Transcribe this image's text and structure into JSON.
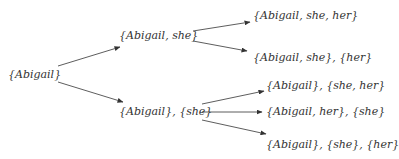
{
  "diagram": {
    "type": "tree",
    "root": {
      "id": "n0",
      "label": "{Abigail}"
    },
    "level1": [
      {
        "id": "n1",
        "label": "{Abigail, she}"
      },
      {
        "id": "n2",
        "label": "{Abigail}, {she}"
      }
    ],
    "level2": [
      {
        "id": "n3",
        "label": "{Abigail, she, her}",
        "parent": "n1"
      },
      {
        "id": "n4",
        "label": "{Abigail, she}, {her}",
        "parent": "n1"
      },
      {
        "id": "n5",
        "label": "{Abigail}, {she, her}",
        "parent": "n2"
      },
      {
        "id": "n6",
        "label": "{Abigail, her}, {she}",
        "parent": "n2"
      },
      {
        "id": "n7",
        "label": "{Abigail}, {she}, {her}",
        "parent": "n2"
      }
    ],
    "edges": [
      {
        "from": "n0",
        "to": "n1"
      },
      {
        "from": "n0",
        "to": "n2"
      },
      {
        "from": "n1",
        "to": "n3"
      },
      {
        "from": "n1",
        "to": "n4"
      },
      {
        "from": "n2",
        "to": "n5"
      },
      {
        "from": "n2",
        "to": "n6"
      },
      {
        "from": "n2",
        "to": "n7"
      }
    ]
  }
}
